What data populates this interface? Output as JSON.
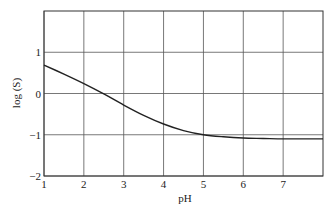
{
  "chart_data": {
    "type": "line",
    "title": "",
    "xlabel": "pH",
    "ylabel": "log (S)",
    "xlim": [
      1,
      8
    ],
    "ylim": [
      -2,
      2
    ],
    "grid": true,
    "legend": null,
    "x_ticks": [
      1,
      2,
      3,
      4,
      5,
      6,
      7
    ],
    "x_tick_labels": [
      "1",
      "2",
      "3",
      "4",
      "5",
      "6",
      "7"
    ],
    "y_ticks": [
      -2,
      -1,
      0,
      1
    ],
    "y_tick_labels": [
      "−2",
      "−1",
      "0",
      "1"
    ],
    "series": [
      {
        "name": "log(S) vs pH",
        "color": "#222222",
        "x": [
          1.0,
          1.5,
          2.0,
          2.5,
          3.0,
          3.5,
          4.0,
          4.5,
          5.0,
          5.5,
          6.0,
          6.5,
          7.0,
          7.5,
          8.0
        ],
        "y": [
          0.69,
          0.47,
          0.24,
          -0.01,
          -0.28,
          -0.53,
          -0.74,
          -0.9,
          -1.0,
          -1.05,
          -1.08,
          -1.09,
          -1.1,
          -1.1,
          -1.1
        ]
      }
    ]
  }
}
